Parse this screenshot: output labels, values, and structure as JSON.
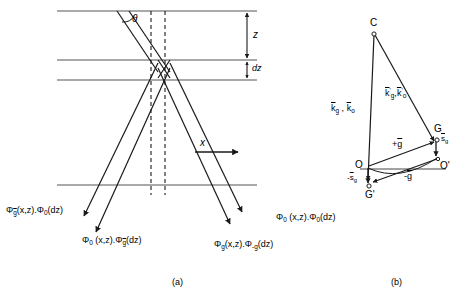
{
  "figure": {
    "panel_a": {
      "caption": "(a)",
      "angle_label": "θ",
      "axis_x_label": "x",
      "depth_label": "z",
      "thickness_label": "dz",
      "wave_labels": [
        {
          "id": "phi-gbar-phi0",
          "parts": [
            {
              "t": "Φ",
              "k": "base"
            },
            {
              "t": "g",
              "k": "sub-ovl"
            },
            {
              "t": "(x,z).",
              "k": "base"
            },
            {
              "t": "Φ",
              "k": "base"
            },
            {
              "t": "0",
              "k": "sub"
            },
            {
              "t": "(dz)",
              "k": "base"
            }
          ]
        },
        {
          "id": "phi0-phi-gbar",
          "parts": [
            {
              "t": "Φ",
              "k": "base"
            },
            {
              "t": "0",
              "k": "sub"
            },
            {
              "t": " (x,z).",
              "k": "base"
            },
            {
              "t": "Φ",
              "k": "base"
            },
            {
              "t": "g",
              "k": "sub-ovl"
            },
            {
              "t": "(dz)",
              "k": "base"
            }
          ]
        },
        {
          "id": "phi0-phi0",
          "parts": [
            {
              "t": "Φ",
              "k": "base"
            },
            {
              "t": "0",
              "k": "sub"
            },
            {
              "t": " (x,z).",
              "k": "base"
            },
            {
              "t": "Φ",
              "k": "base"
            },
            {
              "t": "0",
              "k": "sub"
            },
            {
              "t": "(dz)",
              "k": "base"
            }
          ]
        },
        {
          "id": "phig-phi-minusg",
          "parts": [
            {
              "t": "Φ",
              "k": "base"
            },
            {
              "t": "g",
              "k": "sub"
            },
            {
              "t": "(x,z).",
              "k": "base"
            },
            {
              "t": "Φ",
              "k": "base"
            },
            {
              "t": "-g",
              "k": "sub"
            },
            {
              "t": "(dz)",
              "k": "base"
            }
          ]
        }
      ]
    },
    "panel_b": {
      "caption": "(b)",
      "points": [
        "C",
        "G",
        "O",
        "O'",
        "G'"
      ],
      "vectors": [
        {
          "id": "k-g-k-o",
          "text": "k̄g , k̄o"
        },
        {
          "id": "k-prime-g-k-prime-o",
          "text": "k̄'g , k̄'o"
        },
        {
          "id": "plus-g",
          "text": "+ḡ"
        },
        {
          "id": "minus-g",
          "text": "-ḡ"
        },
        {
          "id": "s-g",
          "text": "s̄g"
        },
        {
          "id": "minus-s-g",
          "text": "-s̄g"
        }
      ]
    }
  },
  "colors": {
    "line": "#1a1a1a",
    "grid_line": "#555555",
    "text": "#000000",
    "background": "#ffffff"
  }
}
